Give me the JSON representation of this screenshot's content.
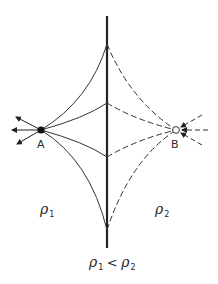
{
  "diagram": {
    "points": [
      {
        "id": "A",
        "label": "A",
        "type": "source",
        "fill": "filled"
      },
      {
        "id": "B",
        "label": "B",
        "type": "sink",
        "fill": "open"
      }
    ],
    "regions": [
      {
        "id": "rho1",
        "symbol": "ρ",
        "subscript": "1"
      },
      {
        "id": "rho2",
        "symbol": "ρ",
        "subscript": "2"
      }
    ],
    "condition": {
      "left_symbol": "ρ",
      "left_sub": "1",
      "relation": "<",
      "right_symbol": "ρ",
      "right_sub": "2"
    },
    "colors": {
      "line": "#222222",
      "background": "#ffffff"
    }
  }
}
